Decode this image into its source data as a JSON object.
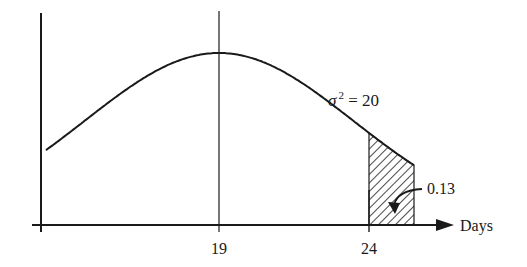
{
  "chart_data": {
    "type": "line",
    "title": "",
    "xlabel": "Days",
    "ylabel": "",
    "distribution": "normal",
    "mean": 19,
    "variance": 20,
    "variance_label": "σ² = 20",
    "x_ticks": [
      19,
      24
    ],
    "x_tick_labels": [
      "19",
      "24"
    ],
    "shaded_region": {
      "from": 24,
      "to": "∞",
      "area": 0.13,
      "label": "0.13"
    },
    "grid": false,
    "legend": null
  },
  "labels": {
    "xlabel": "Days",
    "tick_mean": "19",
    "tick_24": "24",
    "sigma": "σ",
    "sigma_sup": "2",
    "sigma_rest": " = 20",
    "tail_area": "0.13"
  }
}
